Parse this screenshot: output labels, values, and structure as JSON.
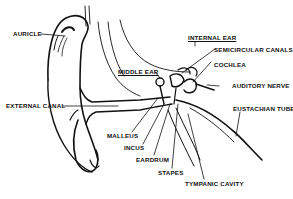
{
  "labels": {
    "auricle": "AURICLE",
    "external_canal": "EXTERNAL CANAL",
    "middle_ear": "MIDDLE EAR",
    "internal_ear": "INTERNAL EAR",
    "semicircular_canals": "SEMICIRCULAR CANALS",
    "cochlea": "COCHLEA",
    "auditory_nerve": "AUDITORY NERVE",
    "eustachian_tube": "EUSTACHIAN TUBE",
    "malleus": "MALLEUS",
    "incus": "INCUS",
    "eardrum": "EARDRUM",
    "stapes": "STAPES",
    "tympanic_cavity": "TYMPANIC CAVITY"
  },
  "colors": {
    "ink": "#111111",
    "background": "#ffffff"
  }
}
